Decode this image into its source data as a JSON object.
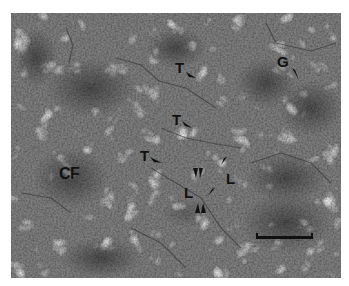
{
  "figure": {
    "type": "grayscale micrograph",
    "labels": [
      {
        "id": "T1",
        "text": "T",
        "x": 175,
        "y": 60,
        "arrow": "down-right"
      },
      {
        "id": "T2",
        "text": "T",
        "x": 172,
        "y": 112,
        "arrow": "down-right"
      },
      {
        "id": "T3",
        "text": "T",
        "x": 140,
        "y": 148,
        "arrow": "down-right"
      },
      {
        "id": "G",
        "text": "G",
        "x": 277,
        "y": 54,
        "arrow": "down-right"
      },
      {
        "id": "CF",
        "text": "CF",
        "x": 59,
        "y": 166,
        "arrow": null
      },
      {
        "id": "L1",
        "text": "L",
        "x": 184,
        "y": 185,
        "arrow": null
      },
      {
        "id": "L2",
        "text": "L",
        "x": 226,
        "y": 171,
        "arrow": null
      }
    ],
    "arrowheads": [
      {
        "x": 195,
        "y": 168,
        "dir": "down"
      },
      {
        "x": 200,
        "y": 168,
        "dir": "down"
      },
      {
        "x": 223,
        "y": 157,
        "dir": "down-left"
      },
      {
        "x": 210,
        "y": 188,
        "dir": "down-left"
      },
      {
        "x": 197,
        "y": 204,
        "dir": "up"
      },
      {
        "x": 202,
        "y": 204,
        "dir": "up"
      }
    ],
    "scale_bar": {
      "x1": 256,
      "x2": 313,
      "y": 237
    }
  }
}
